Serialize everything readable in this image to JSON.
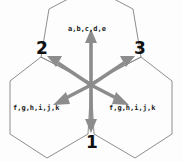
{
  "diagram": {
    "title": "",
    "background_color": "#fdfdfd",
    "hexagon_stroke_color": "#8e8e8e",
    "arrow_color": "#8c8c8c",
    "label_color": "#1a1a1a",
    "number_color": "#111111",
    "cells": [
      {
        "id": "top-cell",
        "position": "top",
        "label": "a,b,c,d,e",
        "label_x": 68,
        "label_y": 25
      },
      {
        "id": "bottom-left-cell",
        "position": "bottom-left",
        "label": "f,g,h,i,j,k",
        "label_x": 13,
        "label_y": 104
      },
      {
        "id": "bottom-right-cell",
        "position": "bottom-right",
        "label": "f,g,h,i,j,k",
        "label_x": 109,
        "label_y": 104
      }
    ],
    "vertices": [
      {
        "id": "vertex-1",
        "number": "1",
        "x": 86,
        "y": 132,
        "position": "bottom-center"
      },
      {
        "id": "vertex-2",
        "number": "2",
        "x": 36,
        "y": 38,
        "position": "upper-left"
      },
      {
        "id": "vertex-3",
        "number": "3",
        "x": 134,
        "y": 38,
        "position": "upper-right"
      }
    ],
    "arrows": [
      {
        "id": "arrow-up",
        "direction": "up",
        "angle_deg": 90
      },
      {
        "id": "arrow-down",
        "direction": "down",
        "angle_deg": 270
      },
      {
        "id": "arrow-upper-left",
        "direction": "upper-left",
        "angle_deg": 150
      },
      {
        "id": "arrow-upper-right",
        "direction": "upper-right",
        "angle_deg": 30
      },
      {
        "id": "arrow-lower-left",
        "direction": "lower-left",
        "angle_deg": 210
      },
      {
        "id": "arrow-lower-right",
        "direction": "lower-right",
        "angle_deg": 330
      }
    ],
    "center": {
      "x": 91,
      "y": 85
    }
  }
}
